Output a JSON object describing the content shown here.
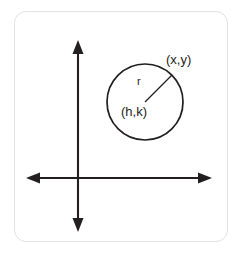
{
  "figure": {
    "background_color": "#ffffff",
    "card": {
      "border_color": "#e2e2e2",
      "fill_color": "#ffffff",
      "corner_radius": 12
    },
    "stroke_color": "#231f20",
    "axes": {
      "name": "coordinate-axes",
      "origin": {
        "x": 78,
        "y": 178
      },
      "vertical": {
        "label": "y-axis",
        "x": 78,
        "top_tip_y": 40,
        "bottom_tip_y": 232,
        "arrow_both_ends": true
      },
      "horizontal": {
        "label": "x-axis",
        "y": 178,
        "left_tip_x": 26,
        "right_tip_x": 212,
        "arrow_both_ends": true
      }
    },
    "circle": {
      "name": "circle",
      "center_x": 145,
      "center_y": 102,
      "radius": 38
    },
    "radius_segment": {
      "name": "radius-segment",
      "from_x": 145,
      "from_y": 102,
      "to_x": 172,
      "to_y": 75
    },
    "labels": {
      "point_on_circle": "(x,y)",
      "radius": "r",
      "center": "(h,k)"
    },
    "label_positions": {
      "point_on_circle": {
        "x": 166,
        "y": 64
      },
      "radius": {
        "x": 137,
        "y": 85
      },
      "center": {
        "x": 121,
        "y": 116
      }
    }
  }
}
